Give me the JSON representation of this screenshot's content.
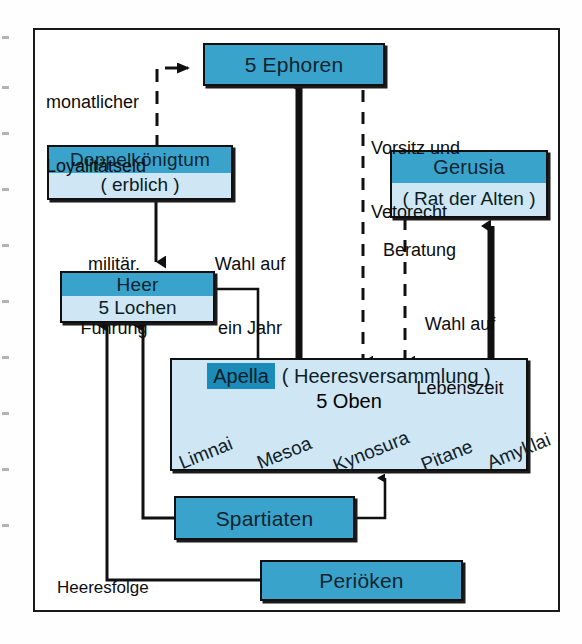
{
  "diagram": {
    "colors": {
      "header_blue": "#3aa3cc",
      "body_blue": "#cfe7f5",
      "chip_blue": "#1b8cba",
      "ink": "#101010",
      "paper": "#ffffff"
    },
    "nodes": [
      {
        "id": "ephoren",
        "title": "5 Ephoren",
        "sub": ""
      },
      {
        "id": "doppelkoenig",
        "title": "Doppelkönigtum",
        "sub": "( erblich )"
      },
      {
        "id": "gerusia",
        "title": "Gerusia",
        "sub": "( Rat der Alten )"
      },
      {
        "id": "heer",
        "title": "Heer",
        "sub": "5 Lochen"
      },
      {
        "id": "spartiaten",
        "title": "Spartiaten",
        "sub": ""
      },
      {
        "id": "perioeken",
        "title": "Periöken",
        "sub": ""
      }
    ],
    "apella": {
      "chip": "Apella",
      "paren": "( Heeresversammlung )",
      "second_line": "5 Oben",
      "oben": [
        "Limnai",
        "Mesoa",
        "Kynosura",
        "Pitane",
        "Amyklai"
      ]
    },
    "edge_labels": [
      {
        "id": "monatlicher",
        "line1": "monatlicher",
        "line2": "Loyalitätseid"
      },
      {
        "id": "vorsitz",
        "line1": "Vorsitz und",
        "line2": "Vetorecht"
      },
      {
        "id": "militaer",
        "line1": "militär.",
        "line2": "Führung"
      },
      {
        "id": "wahl-jahr",
        "line1": "Wahl auf",
        "line2": "ein Jahr"
      },
      {
        "id": "beratung",
        "line1": "Beratung",
        "line2": ""
      },
      {
        "id": "wahl-leben",
        "line1": "Wahl auf",
        "line2": "Lebenszeit"
      },
      {
        "id": "heeresfolge",
        "line1": "Heeresfolge",
        "line2": ""
      }
    ]
  }
}
